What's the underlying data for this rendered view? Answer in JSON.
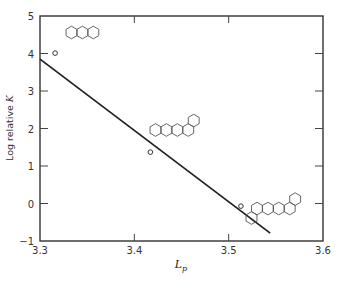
{
  "chart_data": {
    "type": "scatter",
    "title": "",
    "xlabel": "L_p",
    "xlabel_main": "L",
    "xlabel_sub": "p",
    "ylabel": "Log relative K",
    "ylabel_prefix": "Log relative ",
    "ylabel_var": "K",
    "xlim": [
      3.3,
      3.6
    ],
    "ylim": [
      -1,
      5
    ],
    "xticks": [
      "3.3",
      "3.4",
      "3.5",
      "3.6"
    ],
    "yticks": [
      "-1",
      "0",
      "1",
      "2",
      "3",
      "4",
      "5"
    ],
    "grid": false,
    "legend": "none",
    "series": [
      {
        "name": "observed",
        "marker": "open-circle",
        "points": [
          {
            "x": 3.316,
            "y": 4.01,
            "annotation": "anthracene (3 linear fused rings)"
          },
          {
            "x": 3.417,
            "y": 1.37,
            "annotation": "5-ring fused structure"
          },
          {
            "x": 3.513,
            "y": -0.07,
            "annotation": "6-ring fused structure"
          }
        ]
      },
      {
        "name": "fit line",
        "style": "solid-line",
        "points": [
          {
            "x": 3.3,
            "y": 3.85
          },
          {
            "x": 3.544,
            "y": -0.79
          }
        ]
      }
    ],
    "annotations": [
      "anthracene structure near (3.33, 4.6)",
      "5-ring structure near (3.44, 2.3)",
      "6-ring structure near (3.55, 0.6)"
    ]
  }
}
